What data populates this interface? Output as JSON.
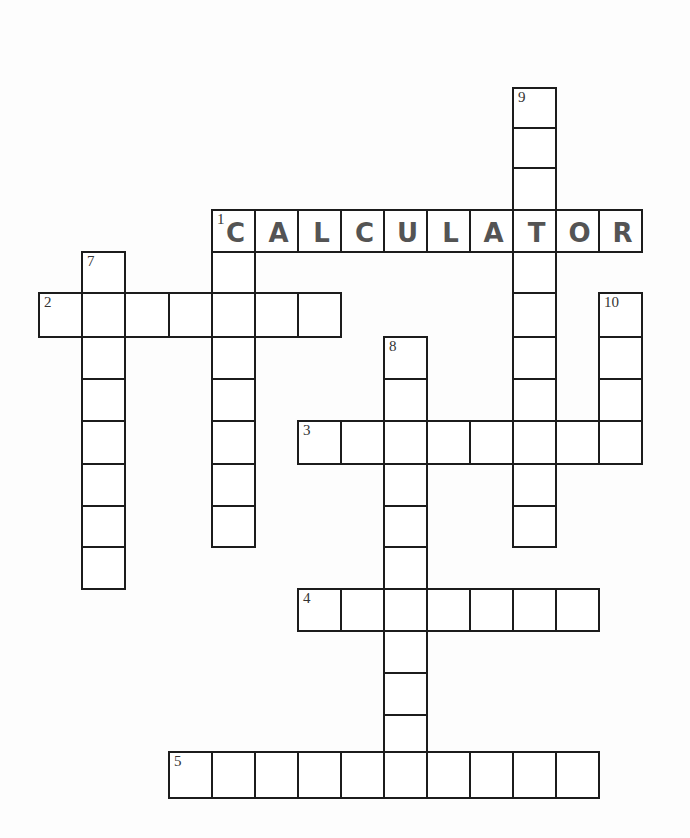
{
  "puzzle": {
    "cell_size": 43,
    "line_color": "#1c1c1c",
    "letter_color": "#545454",
    "entries": [
      {
        "number": "1",
        "direction": "across",
        "length": 10,
        "answer_shown": "CALCULATOR",
        "x": 211,
        "y": 209
      },
      {
        "number": "2",
        "direction": "across",
        "length": 7,
        "x": 38,
        "y": 292
      },
      {
        "number": "3",
        "direction": "across",
        "length": 8,
        "x": 297,
        "y": 420
      },
      {
        "number": "4",
        "direction": "across",
        "length": 7,
        "x": 297,
        "y": 588
      },
      {
        "number": "5",
        "direction": "across",
        "length": 10,
        "x": 168,
        "y": 751
      },
      {
        "number": "1",
        "direction": "down",
        "length": 8,
        "x": 211,
        "y": 209
      },
      {
        "number": "7",
        "direction": "down",
        "length": 8,
        "x": 81,
        "y": 251
      },
      {
        "number": "8",
        "direction": "down",
        "length": 11,
        "x": 383,
        "y": 336
      },
      {
        "number": "9",
        "direction": "down",
        "length": 11,
        "x": 512,
        "y": 87
      },
      {
        "number": "10",
        "direction": "down",
        "length": 4,
        "x": 598,
        "y": 292
      }
    ]
  },
  "labels": {
    "n1": "1",
    "n2": "2",
    "n3": "3",
    "n4": "4",
    "n5": "5",
    "n7": "7",
    "n8": "8",
    "n9": "9",
    "n10": "10"
  },
  "answers": {
    "1_across": [
      "C",
      "A",
      "L",
      "C",
      "U",
      "L",
      "A",
      "T",
      "O",
      "R"
    ]
  }
}
